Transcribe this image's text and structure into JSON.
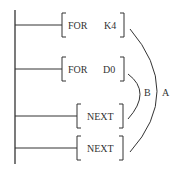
{
  "diagram": {
    "type": "ladder-logic",
    "rungs": [
      {
        "instruction": "FOR",
        "operand": "K4"
      },
      {
        "instruction": "FOR",
        "operand": "D0"
      },
      {
        "instruction": "NEXT",
        "operand": ""
      },
      {
        "instruction": "NEXT",
        "operand": ""
      }
    ],
    "loops": [
      {
        "label": "B",
        "from_rung": 2,
        "to_rung": 3
      },
      {
        "label": "A",
        "from_rung": 1,
        "to_rung": 4
      }
    ],
    "colors": {
      "line": "#333333",
      "background": "#ffffff"
    }
  }
}
